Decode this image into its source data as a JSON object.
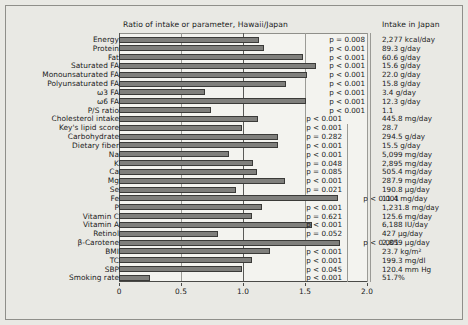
{
  "header": {
    "ratio_title": "Ratio of intake or parameter, Hawaii/Japan",
    "intake_title": "Intake in Japan"
  },
  "axis": {
    "ticks": [
      "0",
      "0.5",
      "1.0",
      "1.5",
      "2.0"
    ],
    "tick_values": [
      0,
      0.5,
      1.0,
      1.5,
      2.0
    ],
    "xmin": 0,
    "xmax": 2.0
  },
  "chart_data": {
    "type": "bar",
    "orientation": "horizontal",
    "title": "Ratio of intake or parameter, Hawaii/Japan",
    "xlabel": "",
    "ylabel": "",
    "xlim": [
      0,
      2.0
    ],
    "grid": true,
    "legend": "none",
    "categories": [
      "Energy",
      "Protein",
      "Fat",
      "Saturated FA",
      "Monounsaturated FA",
      "Polyunsaturated FA",
      "ω3 FA",
      "ω6 FA",
      "P/S ratio",
      "Cholesterol intake",
      "Key's lipid score",
      "Carbohydrate",
      "Dietary fiber",
      "Na",
      "K",
      "Ca",
      "Mg",
      "Se",
      "Fe",
      "P",
      "Vitamin C",
      "Vitamin A",
      "Retinol",
      "β-Carotene",
      "BMI",
      "TC",
      "SBP",
      "Smoking rate"
    ],
    "values": [
      1.13,
      1.17,
      1.48,
      1.59,
      1.52,
      1.35,
      0.69,
      1.51,
      0.74,
      1.12,
      0.99,
      1.28,
      1.28,
      0.89,
      1.08,
      1.11,
      1.34,
      0.94,
      1.77,
      1.15,
      1.07,
      1.56,
      0.8,
      1.78,
      1.22,
      1.07,
      0.99,
      0.25
    ],
    "pvalues": [
      "p = 0.008",
      "p < 0.001",
      "p < 0.001",
      "p < 0.001",
      "p < 0.001",
      "p < 0.001",
      "p < 0.001",
      "p < 0.001",
      "p < 0.001",
      "p < 0.001",
      "p < 0.001",
      "p = 0.282",
      "p < 0.001",
      "p < 0.001",
      "p = 0.048",
      "p = 0.085",
      "p < 0.001",
      "p = 0.021",
      "p < 0.001",
      "p < 0.001",
      "p = 0.621",
      "p < 0.001",
      "p = 0.052",
      "p < 0.001",
      "p < 0.001",
      "p < 0.001",
      "p < 0.045",
      "p < 0.001"
    ],
    "intake_in_japan": [
      "2,277 kcal/day",
      "89.3 g/day",
      "60.6 g/day",
      "15.6 g/day",
      "22.0 g/day",
      "15.8 g/day",
      "3.4 g/day",
      "12.3 g/day",
      "1.1",
      "445.8 mg/day",
      "28.7",
      "294.5 g/day",
      "15.5 g/day",
      "5,099 mg/day",
      "2,895 mg/day",
      "505.4 mg/day",
      "287.9 mg/day",
      "190.8 µg/day",
      "11.4 mg/day",
      "1,231.8 mg/day",
      "125.6 mg/day",
      "6,188 IU/day",
      "427 µg/day",
      "2,859 µg/day",
      "23.7 kg/m²",
      "199.3 mg/dl",
      "120.4 mm Hg",
      "51.7%"
    ]
  },
  "colors": {
    "bar_fill": "#7f7f7c",
    "bar_stroke": "#3a3a38",
    "panel_bg": "#f3f3ef",
    "figure_bg": "#e9e9e4",
    "text": "#1a1a1a"
  }
}
